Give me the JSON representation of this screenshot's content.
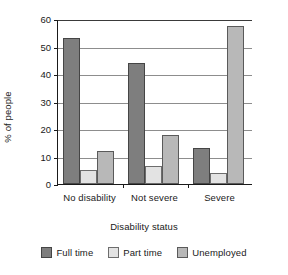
{
  "chart_data": {
    "type": "bar",
    "title": "",
    "xlabel": "Disability status",
    "ylabel": "% of people",
    "categories": [
      "No disability",
      "Not severe",
      "Severe"
    ],
    "series": [
      {
        "name": "Full time",
        "color": "#7e7e7e",
        "values": [
          53,
          44,
          13
        ]
      },
      {
        "name": "Part time",
        "color": "#e3e3e3",
        "values": [
          5,
          6.5,
          4
        ]
      },
      {
        "name": "Unemployed",
        "color": "#b8b8b8",
        "values": [
          12,
          18,
          57.5
        ]
      }
    ],
    "ylim": [
      0,
      60
    ],
    "yticks": [
      0,
      10,
      20,
      30,
      40,
      50,
      60
    ],
    "ytick_labels": [
      "0",
      "10",
      "20",
      "30",
      "40",
      "50",
      "60"
    ],
    "grid": true,
    "legend_position": "bottom"
  }
}
